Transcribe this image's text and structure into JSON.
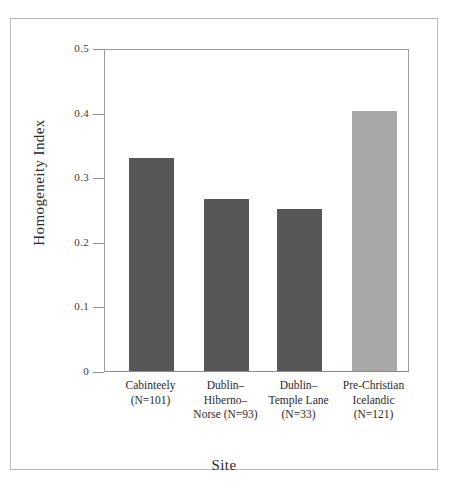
{
  "chart_data": {
    "type": "bar",
    "title": "",
    "xlabel": "Site",
    "ylabel": "Homogeneity Index",
    "categories": [
      "Cabinteely\n(N=101)",
      "Dublin–\nHiberno–\nNorse (N=93)",
      "Dublin–\nTemple Lane\n(N=33)",
      "Pre-Christian\nIcelandic\n(N=121)"
    ],
    "category_names": [
      "Cabinteely",
      "Dublin–Hiberno–Norse",
      "Dublin–Temple Lane",
      "Pre-Christian Icelandic"
    ],
    "sample_sizes": [
      101,
      93,
      33,
      121
    ],
    "values": [
      0.33,
      0.267,
      0.251,
      0.402
    ],
    "bar_colors": [
      "#575757",
      "#575757",
      "#575757",
      "#a8a8a8"
    ],
    "ylim": [
      0,
      0.5
    ],
    "yticks": [
      0,
      0.1,
      0.2,
      0.3,
      0.4,
      0.5
    ],
    "ytick_labels": [
      "0",
      "0.1",
      "0.2",
      "0.3",
      "0.4",
      "0.5"
    ],
    "grid": false,
    "legend": "none"
  },
  "axes": {
    "y_title": "Homogeneity Index",
    "x_title": "Site"
  }
}
